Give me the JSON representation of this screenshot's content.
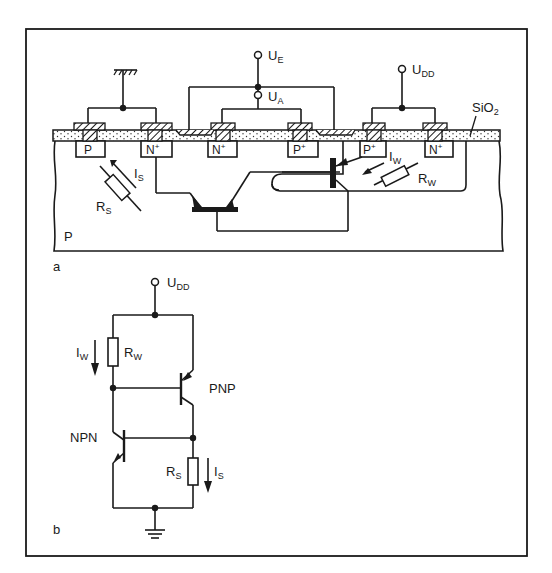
{
  "figure": {
    "panel_a_label": "a",
    "panel_b_label": "b"
  },
  "cross_section": {
    "substrate_label": "P",
    "oxide_label": "SiO",
    "oxide_sub": "2",
    "terminals": {
      "input": {
        "main": "U",
        "sub": "E"
      },
      "output": {
        "main": "U",
        "sub": "A"
      },
      "supply": {
        "main": "U",
        "sub": "DD"
      }
    },
    "diffusions": [
      {
        "main": "P",
        "sup": ""
      },
      {
        "main": "N",
        "sup": "+"
      },
      {
        "main": "N",
        "sup": "+"
      },
      {
        "main": "P",
        "sup": "+"
      },
      {
        "main": "P",
        "sup": "+"
      },
      {
        "main": "N",
        "sup": "+"
      }
    ],
    "resistor_s": {
      "main": "R",
      "sub": "S"
    },
    "current_s": {
      "main": "I",
      "sub": "S"
    },
    "resistor_w": {
      "main": "R",
      "sub": "W"
    },
    "current_w": {
      "main": "I",
      "sub": "W"
    }
  },
  "schematic": {
    "supply": {
      "main": "U",
      "sub": "DD"
    },
    "resistor_w": {
      "main": "R",
      "sub": "W"
    },
    "current_w": {
      "main": "I",
      "sub": "W"
    },
    "resistor_s": {
      "main": "R",
      "sub": "S"
    },
    "current_s": {
      "main": "I",
      "sub": "S"
    },
    "pnp_label": "PNP",
    "npn_label": "NPN"
  },
  "colors": {
    "ink": "#1a1a1a",
    "paper": "#ffffff"
  }
}
